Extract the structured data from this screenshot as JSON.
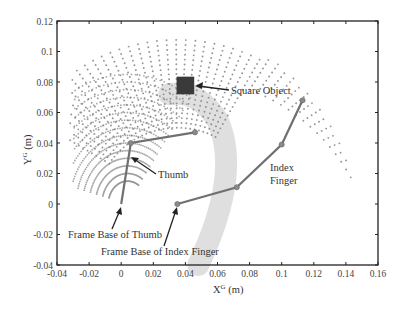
{
  "chart_data": {
    "type": "scatter",
    "title": "",
    "xlabel": "X^G (m)",
    "ylabel": "Y^G (m)",
    "xlim": [
      -0.04,
      0.16
    ],
    "ylim": [
      -0.04,
      0.12
    ],
    "xticks": [
      "-0.04",
      "-0.02",
      "0",
      "0.02",
      "0.04",
      "0.06",
      "0.08",
      "0.1",
      "0.12",
      "0.14",
      "0.16"
    ],
    "yticks": [
      "-0.04",
      "-0.02",
      "0",
      "0.02",
      "0.04",
      "0.06",
      "0.08",
      "0.1",
      "0.12"
    ],
    "grid": false,
    "series": [
      {
        "name": "Thumb",
        "type": "line",
        "color": "#707070",
        "x": [
          0.0,
          0.006,
          0.046
        ],
        "y": [
          0.0,
          0.04,
          0.047
        ]
      },
      {
        "name": "Index Finger",
        "type": "line",
        "color": "#707070",
        "x": [
          0.035,
          0.072,
          0.1,
          0.113
        ],
        "y": [
          0.0,
          0.011,
          0.039,
          0.068
        ]
      },
      {
        "name": "Square Object",
        "type": "marker",
        "color": "#3a3a3a",
        "x": [
          0.04
        ],
        "y": [
          0.078
        ],
        "size": 0.011
      },
      {
        "name": "Thumb workspace",
        "type": "scatter-fan",
        "color": "#8c8c8c",
        "center": [
          0.0,
          0.0
        ],
        "r_inner": 0.035,
        "r_outer": 0.075,
        "angle_range_deg": [
          60,
          160
        ]
      },
      {
        "name": "Index workspace (outer fan)",
        "type": "scatter-fan",
        "color": "#7a7a7a",
        "center": [
          0.035,
          0.0
        ],
        "r_outer": 0.11,
        "angle_range_deg": [
          2,
          170
        ]
      },
      {
        "name": "Index workspace (light band)",
        "type": "area",
        "color": "#d9d9d9",
        "center": [
          0.035,
          0.0
        ],
        "r_inner": 0.012,
        "r_outer": 0.045
      }
    ],
    "annotations": [
      {
        "text": "Square Object",
        "x": 0.056,
        "y": 0.075,
        "arrow_to": [
          0.045,
          0.079
        ]
      },
      {
        "text": "Thumb",
        "x": 0.017,
        "y": 0.018,
        "arrow_to": [
          0.006,
          0.027
        ]
      },
      {
        "text": "Index",
        "x": 0.078,
        "y": 0.027
      },
      {
        "text": "Finger",
        "x": 0.078,
        "y": 0.019
      },
      {
        "text": "Frame Base of Thumb",
        "x": -0.032,
        "y": -0.013,
        "arrow_to": [
          0.0,
          0.0
        ]
      },
      {
        "text": "Frame Base of Index Finger",
        "x": -0.012,
        "y": -0.025,
        "arrow_to": [
          0.035,
          0.0
        ]
      }
    ]
  },
  "labels": {
    "square_object": "Square Object",
    "thumb": "Thumb",
    "index_1": "Index",
    "index_2": "Finger",
    "frame_base_thumb": "Frame Base of Thumb",
    "frame_base_index": "Frame Base of Index Finger",
    "x_axis_main": "X",
    "x_axis_sup": "G",
    "x_axis_unit": " (m)",
    "y_axis_main": "Y",
    "y_axis_sup": "G",
    "y_axis_unit": " (m)"
  }
}
